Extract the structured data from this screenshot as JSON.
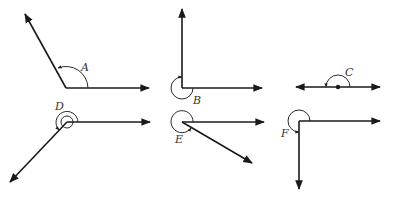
{
  "diagram": {
    "type": "angle-types",
    "angles": [
      {
        "label": "A",
        "kind": "obtuse"
      },
      {
        "label": "B",
        "kind": "reflex"
      },
      {
        "label": "C",
        "kind": "straight"
      },
      {
        "label": "D",
        "kind": "reflex-double"
      },
      {
        "label": "E",
        "kind": "reflex"
      },
      {
        "label": "F",
        "kind": "reflex"
      }
    ]
  }
}
